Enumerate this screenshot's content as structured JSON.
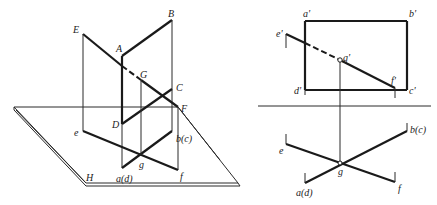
{
  "figure": {
    "left_view": {
      "title": "3D pictorial view",
      "plane_label": "H",
      "labels": {
        "E": "E",
        "A": "A",
        "B": "B",
        "G": "G",
        "C": "C",
        "D": "D",
        "F": "F",
        "e": "e",
        "g": "g",
        "f": "f",
        "bc": "b(c)",
        "ad": "a(d)"
      }
    },
    "right_view": {
      "title": "Orthographic projection",
      "labels": {
        "a_prime": "a'",
        "b_prime": "b'",
        "c_prime": "c'",
        "d_prime": "d'",
        "e_prime": "e'",
        "f_prime": "f'",
        "g_prime": "g'",
        "e": "e",
        "g": "g",
        "f": "f",
        "bc": "b(c)",
        "ad": "a(d)"
      }
    },
    "colors": {
      "line": "#1a1a1a",
      "background": "#ffffff"
    }
  }
}
